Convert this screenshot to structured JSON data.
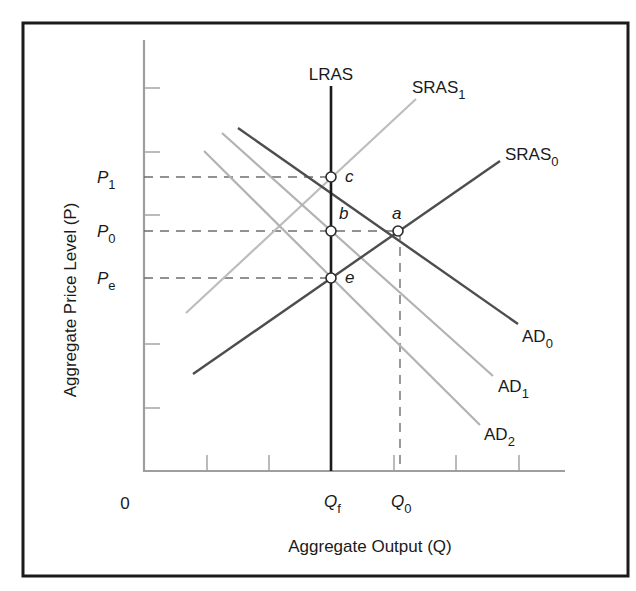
{
  "chart_data": {
    "type": "line",
    "title": "",
    "xlabel": "Aggregate Output (Q)",
    "ylabel": "Aggregate Price Level (P)",
    "origin_label": "0",
    "grid": false,
    "legend_position": "inline",
    "x_tick_labels": [
      {
        "id": "qf",
        "base": "Q",
        "sub": "f",
        "x": 331
      },
      {
        "id": "q0",
        "base": "Q",
        "sub": "0",
        "x": 398
      }
    ],
    "y_tick_labels": [
      {
        "id": "p1",
        "base": "P",
        "sub": "1",
        "y": 177
      },
      {
        "id": "p0",
        "base": "P",
        "sub": "0",
        "y": 231
      },
      {
        "id": "pe",
        "base": "P",
        "sub": "e",
        "y": 278
      }
    ],
    "series": [
      {
        "name": "LRAS",
        "label_base": "LRAS",
        "label_sub": "",
        "color": "#1a1a1a",
        "width": 2.6,
        "points": [
          [
            331,
            86
          ],
          [
            331,
            471
          ]
        ],
        "label_pos": [
          331,
          80
        ],
        "anchor": "middle"
      },
      {
        "name": "SRAS1",
        "label_base": "SRAS",
        "label_sub": "1",
        "color": "#bdbdbd",
        "width": 2.2,
        "points": [
          [
            186,
            313
          ],
          [
            416,
            99
          ]
        ],
        "label_pos": [
          412,
          93
        ],
        "anchor": "start"
      },
      {
        "name": "SRAS0",
        "label_base": "SRAS",
        "label_sub": "0",
        "color": "#4d4d4d",
        "width": 2.4,
        "points": [
          [
            193,
            374
          ],
          [
            500,
            161
          ]
        ],
        "label_pos": [
          505,
          160
        ],
        "anchor": "start"
      },
      {
        "name": "AD0",
        "label_base": "AD",
        "label_sub": "0",
        "color": "#4d4d4d",
        "width": 2.4,
        "points": [
          [
            238,
            128
          ],
          [
            518,
            324
          ]
        ],
        "label_pos": [
          522,
          342
        ],
        "anchor": "start"
      },
      {
        "name": "AD1",
        "label_base": "AD",
        "label_sub": "1",
        "color": "#b3b3b3",
        "width": 2.2,
        "points": [
          [
            222,
            133
          ],
          [
            493,
            376
          ]
        ],
        "label_pos": [
          498,
          392
        ],
        "anchor": "start"
      },
      {
        "name": "AD2",
        "label_base": "AD",
        "label_sub": "2",
        "color": "#b3b3b3",
        "width": 2.2,
        "points": [
          [
            204,
            151
          ],
          [
            480,
            425
          ]
        ],
        "label_pos": [
          484,
          440
        ],
        "anchor": "start"
      }
    ],
    "equilibrium_points": [
      {
        "id": "a",
        "label": "a",
        "x": 398,
        "y": 231,
        "label_dx": -6,
        "label_dy": -12
      },
      {
        "id": "b",
        "label": "b",
        "x": 331,
        "y": 231,
        "label_dx": 8,
        "label_dy": -12
      },
      {
        "id": "c",
        "label": "c",
        "x": 331,
        "y": 177,
        "label_dx": 14,
        "label_dy": 5
      },
      {
        "id": "e",
        "label": "e",
        "x": 331,
        "y": 278,
        "label_dx": 14,
        "label_dy": 5
      }
    ],
    "dashed_guides": [
      {
        "from": [
          144,
          177
        ],
        "to": [
          331,
          177
        ]
      },
      {
        "from": [
          144,
          231
        ],
        "to": [
          398,
          231
        ]
      },
      {
        "from": [
          144,
          278
        ],
        "to": [
          331,
          278
        ]
      },
      {
        "from": [
          400,
          231
        ],
        "to": [
          400,
          471
        ]
      }
    ],
    "axes": {
      "origin": [
        144,
        471
      ],
      "x_end": 565,
      "y_top": 40,
      "y_ticks": [
        88,
        152,
        215,
        344,
        408
      ],
      "x_ticks": [
        207,
        269,
        394,
        456,
        519
      ],
      "color": "#9e9e9e"
    },
    "frame": {
      "x": 23,
      "y": 23,
      "w": 605,
      "h": 553,
      "color": "#1a1a1a"
    }
  }
}
